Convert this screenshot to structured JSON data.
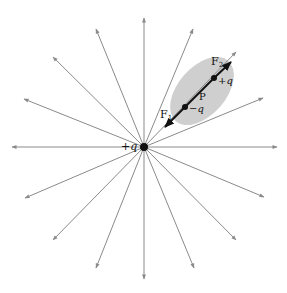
{
  "diagram": {
    "colors": {
      "field_line": "#8a8a8a",
      "dipole": "#111111",
      "ellipse": "#cfcfcf",
      "charge": "#111111"
    },
    "source_charge": {
      "label": "+q",
      "x": 144,
      "y": 147,
      "r": 4
    },
    "field_lines": [
      {
        "x2": 144,
        "y2": 18
      },
      {
        "x2": 193,
        "y2": 29
      },
      {
        "x2": 236,
        "y2": 52
      },
      {
        "x2": 263,
        "y2": 98
      },
      {
        "x2": 277,
        "y2": 147
      },
      {
        "x2": 264,
        "y2": 197
      },
      {
        "x2": 236,
        "y2": 240
      },
      {
        "x2": 194,
        "y2": 268
      },
      {
        "x2": 144,
        "y2": 279
      },
      {
        "x2": 96,
        "y2": 268
      },
      {
        "x2": 53,
        "y2": 240
      },
      {
        "x2": 25,
        "y2": 198
      },
      {
        "x2": 12,
        "y2": 147
      },
      {
        "x2": 24,
        "y2": 99
      },
      {
        "x2": 53,
        "y2": 57
      },
      {
        "x2": 96,
        "y2": 29
      }
    ],
    "dipole": {
      "label": "P",
      "ellipse": {
        "cx": 202,
        "cy": 91,
        "rx": 40,
        "ry": 24,
        "rotate": -49
      },
      "negative_charge": {
        "label": "−q",
        "x": 185,
        "y": 107
      },
      "positive_charge": {
        "label": "+q",
        "x": 214,
        "y": 78
      },
      "force_1": {
        "label": "F",
        "sub": "1",
        "x1": 185,
        "y1": 107,
        "x2": 165,
        "y2": 127
      },
      "force_2": {
        "label": "F",
        "sub": "2",
        "x1": 214,
        "y1": 78,
        "x2": 231,
        "y2": 62
      }
    }
  }
}
